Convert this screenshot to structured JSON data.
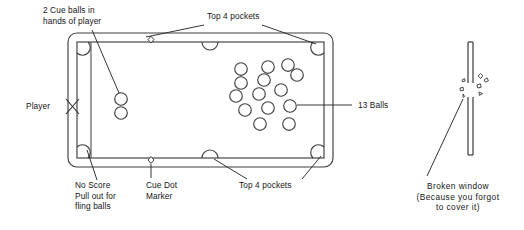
{
  "diagram": {
    "style": "line-art-schematic"
  },
  "labels": {
    "cue_balls": "2 Cue balls in\nhands of player",
    "top_pockets_upper": "Top 4 pockets",
    "top_pockets_lower": "Top 4 pockets",
    "player": "Player",
    "thirteen_balls": "13 Balls",
    "no_score": "No Score\nPull out for\nfling balls",
    "cue_dot_marker": "Cue Dot\nMarker",
    "broken_window": "Broken window\n(Because you forgot\nto cover it)"
  },
  "colors": {
    "ink": "#141414",
    "line": "#3a3a3a",
    "background": "#ffffff"
  },
  "table": {
    "outer_rail": {
      "x": 68,
      "y": 33,
      "width": 265,
      "height": 134,
      "corner_radius": 9
    },
    "inner_playfield": {
      "x": 77,
      "y": 42,
      "width": 247,
      "height": 116
    },
    "pocket_count": 6,
    "pockets": [
      {
        "name": "corner-top-left",
        "x": 83,
        "y": 48,
        "r": 5.2,
        "type": "corner"
      },
      {
        "name": "side-top",
        "x": 210,
        "y": 45,
        "r": 7.0,
        "type": "side"
      },
      {
        "name": "corner-top-right",
        "x": 318,
        "y": 48,
        "r": 5.2,
        "type": "corner"
      },
      {
        "name": "corner-bottom-left",
        "x": 83,
        "y": 152,
        "r": 5.2,
        "type": "corner"
      },
      {
        "name": "side-bottom",
        "x": 210,
        "y": 155,
        "r": 7.0,
        "type": "side"
      },
      {
        "name": "corner-bottom-right",
        "x": 318,
        "y": 152,
        "r": 5.2,
        "type": "corner"
      }
    ],
    "cue_dot_markers": [
      {
        "name": "cue-dot-top",
        "x": 151,
        "y": 40,
        "r": 3.0
      },
      {
        "name": "cue-dot-bottom",
        "x": 151,
        "y": 160,
        "r": 3.0
      }
    ]
  },
  "cue_balls": {
    "count": 2,
    "radius": 6.3,
    "positions": [
      {
        "x": 121,
        "y": 99
      },
      {
        "x": 121,
        "y": 113
      }
    ]
  },
  "object_balls": {
    "count": 13,
    "radius": 6.3,
    "positions": [
      {
        "x": 241,
        "y": 69
      },
      {
        "x": 268,
        "y": 67
      },
      {
        "x": 288,
        "y": 65
      },
      {
        "x": 241,
        "y": 83
      },
      {
        "x": 264,
        "y": 80
      },
      {
        "x": 297,
        "y": 75
      },
      {
        "x": 236,
        "y": 96
      },
      {
        "x": 259,
        "y": 94
      },
      {
        "x": 281,
        "y": 90
      },
      {
        "x": 245,
        "y": 110
      },
      {
        "x": 268,
        "y": 108
      },
      {
        "x": 290,
        "y": 106
      },
      {
        "x": 260,
        "y": 124
      },
      {
        "x": 289,
        "y": 124
      }
    ]
  },
  "player_marker": {
    "symbol": "X",
    "x": 72,
    "y": 106
  },
  "window": {
    "pane": {
      "x": 468,
      "y": 42,
      "width": 5,
      "height": 113
    },
    "break_point": {
      "x": 470,
      "y": 92
    },
    "shards": 7
  },
  "leaders": [
    {
      "name": "leader-cue-balls",
      "from": {
        "x": 92,
        "y": 33
      },
      "to": {
        "x": 118,
        "y": 92
      }
    },
    {
      "name": "leader-top-pocket-left",
      "from": {
        "x": 202,
        "y": 24
      },
      "to": {
        "x": 146,
        "y": 38
      }
    },
    {
      "name": "leader-top-pocket-right",
      "from": {
        "x": 262,
        "y": 24
      },
      "to": {
        "x": 316,
        "y": 45
      }
    },
    {
      "name": "leader-13-balls",
      "from": {
        "x": 352,
        "y": 105
      },
      "to": {
        "x": 296,
        "y": 105
      }
    },
    {
      "name": "leader-no-score",
      "from": {
        "x": 96,
        "y": 182
      },
      "to": {
        "x": 88,
        "y": 152
      }
    },
    {
      "name": "leader-cue-dot",
      "from": {
        "x": 151,
        "y": 180
      },
      "to": {
        "x": 151,
        "y": 163
      }
    },
    {
      "name": "leader-bottom-pocket-left",
      "from": {
        "x": 245,
        "y": 180
      },
      "to": {
        "x": 214,
        "y": 158
      }
    },
    {
      "name": "leader-bottom-pocket-right",
      "from": {
        "x": 300,
        "y": 180
      },
      "to": {
        "x": 321,
        "y": 157
      }
    },
    {
      "name": "leader-broken-window",
      "from": {
        "x": 427,
        "y": 178
      },
      "to": {
        "x": 464,
        "y": 98
      }
    }
  ]
}
